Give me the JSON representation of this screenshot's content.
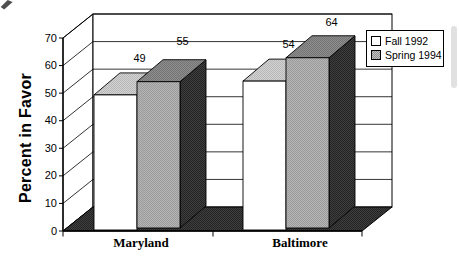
{
  "chart_data": {
    "type": "bar",
    "projection": "3d-column",
    "title": "",
    "categories": [
      "Maryland",
      "Baltimore"
    ],
    "series": [
      {
        "name": "Fall 1992",
        "values": [
          49,
          54
        ],
        "color": "#ffffff"
      },
      {
        "name": "Spring 1994",
        "values": [
          55,
          64
        ],
        "color": "#b5b5b5"
      }
    ],
    "show_data_labels": true,
    "data_labels": [
      "49",
      "55",
      "54",
      "64"
    ],
    "xlabel": "",
    "ylabel": "Percent in Favor",
    "ylim": [
      0,
      70
    ],
    "yticks": [
      0,
      10,
      20,
      30,
      40,
      50,
      60,
      70
    ],
    "grid": true,
    "legend": {
      "position": "top-right",
      "entries": [
        "Fall 1992",
        "Spring 1994"
      ]
    }
  },
  "colors": {
    "background": "#ffffff",
    "line": "#000000",
    "wall": "#ffffff",
    "floor": "#3e3e3e",
    "fall_front": "#ffffff",
    "fall_top": "#d2d2d2",
    "spring_front": "#b5b5b5",
    "spring_top": "#8e8e8e",
    "spring_side": "#3e3e3e",
    "legend_bg": "#ffffff"
  }
}
